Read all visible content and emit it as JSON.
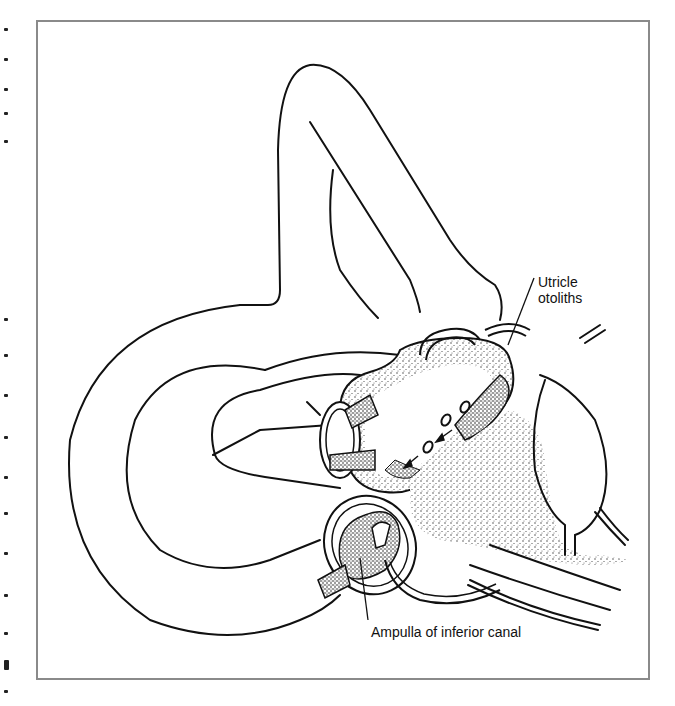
{
  "figure": {
    "type": "anatomical line illustration",
    "labels": {
      "utricle_line1": "Utricle",
      "utricle_line2": "otoliths",
      "ampulla": "Ampulla of inferior canal"
    }
  },
  "colors": {
    "ink": "#111111",
    "frame": "#8a8a8a",
    "background": "#ffffff"
  }
}
